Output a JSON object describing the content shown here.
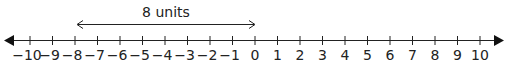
{
  "number_line": {
    "min": -10,
    "max": 10,
    "step": 1,
    "tick_labels": [
      "−10",
      "−9",
      "−8",
      "−7",
      "−6",
      "−5",
      "−4",
      "−3",
      "−2",
      "−1",
      "0",
      "1",
      "2",
      "3",
      "4",
      "5",
      "6",
      "7",
      "8",
      "9",
      "10"
    ],
    "arrows_both_ends": true,
    "line_color": "#222222"
  },
  "annotation": {
    "label": "8 units",
    "from": -8,
    "to": 0,
    "style": "double-headed arrow"
  }
}
